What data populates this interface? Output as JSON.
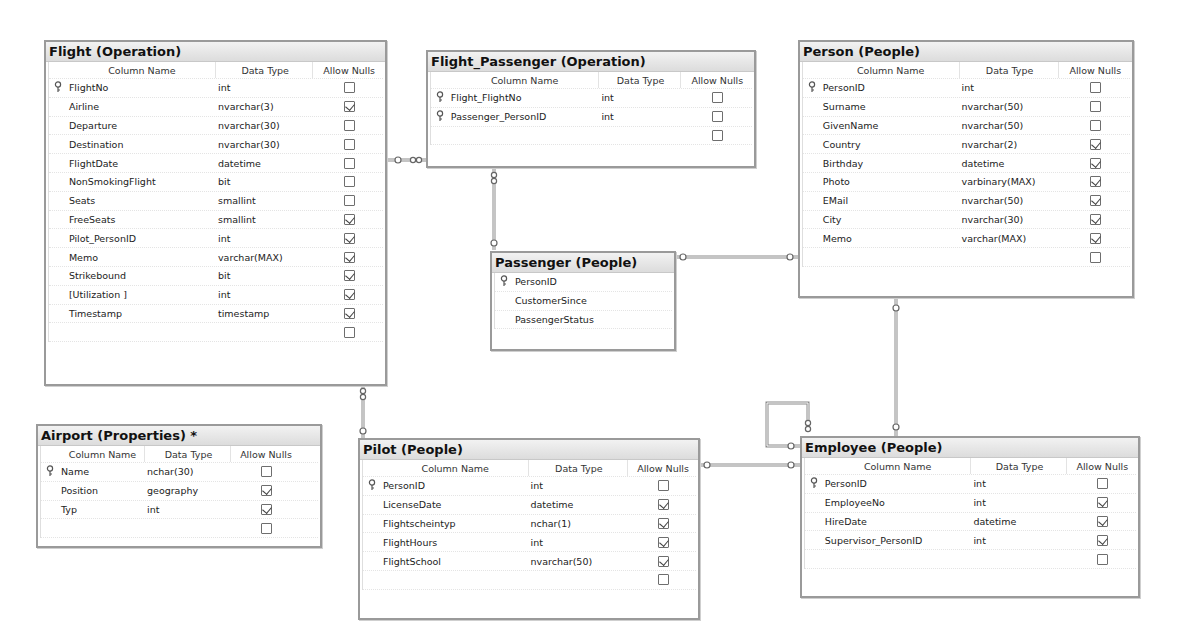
{
  "diagram": {
    "column_headers": {
      "name": "Column Name",
      "type": "Data Type",
      "nulls": "Allow Nulls"
    },
    "icons": {
      "primary_key": "key-icon",
      "checkbox_checked": "checkbox-checked-icon",
      "checkbox_unchecked": "checkbox-unchecked-icon",
      "relationship_connector": "relationship-line"
    },
    "tables": {
      "flight": {
        "title": "Flight (Operation)",
        "rows": [
          {
            "key": true,
            "name": "FlightNo",
            "type": "int",
            "nulls": false
          },
          {
            "key": false,
            "name": "Airline",
            "type": "nvarchar(3)",
            "nulls": true
          },
          {
            "key": false,
            "name": "Departure",
            "type": "nvarchar(30)",
            "nulls": false
          },
          {
            "key": false,
            "name": "Destination",
            "type": "nvarchar(30)",
            "nulls": false
          },
          {
            "key": false,
            "name": "FlightDate",
            "type": "datetime",
            "nulls": false
          },
          {
            "key": false,
            "name": "NonSmokingFlight",
            "type": "bit",
            "nulls": false
          },
          {
            "key": false,
            "name": "Seats",
            "type": "smallint",
            "nulls": false
          },
          {
            "key": false,
            "name": "FreeSeats",
            "type": "smallint",
            "nulls": true
          },
          {
            "key": false,
            "name": "Pilot_PersonID",
            "type": "int",
            "nulls": true
          },
          {
            "key": false,
            "name": "Memo",
            "type": "varchar(MAX)",
            "nulls": true
          },
          {
            "key": false,
            "name": "Strikebound",
            "type": "bit",
            "nulls": true
          },
          {
            "key": false,
            "name": "[Utilization ]",
            "type": "int",
            "nulls": true
          },
          {
            "key": false,
            "name": "Timestamp",
            "type": "timestamp",
            "nulls": true
          },
          {
            "key": false,
            "name": "",
            "type": "",
            "nulls": false
          }
        ]
      },
      "flight_passenger": {
        "title": "Flight_Passenger (Operation)",
        "rows": [
          {
            "key": true,
            "name": "Flight_FlightNo",
            "type": "int",
            "nulls": false
          },
          {
            "key": true,
            "name": "Passenger_PersonID",
            "type": "int",
            "nulls": false
          },
          {
            "key": false,
            "name": "",
            "type": "",
            "nulls": false
          }
        ]
      },
      "person": {
        "title": "Person (People)",
        "rows": [
          {
            "key": true,
            "name": "PersonID",
            "type": "int",
            "nulls": false
          },
          {
            "key": false,
            "name": "Surname",
            "type": "nvarchar(50)",
            "nulls": false
          },
          {
            "key": false,
            "name": "GivenName",
            "type": "nvarchar(50)",
            "nulls": false
          },
          {
            "key": false,
            "name": "Country",
            "type": "nvarchar(2)",
            "nulls": true
          },
          {
            "key": false,
            "name": "Birthday",
            "type": "datetime",
            "nulls": true
          },
          {
            "key": false,
            "name": "Photo",
            "type": "varbinary(MAX)",
            "nulls": true
          },
          {
            "key": false,
            "name": "EMail",
            "type": "nvarchar(50)",
            "nulls": true
          },
          {
            "key": false,
            "name": "City",
            "type": "nvarchar(30)",
            "nulls": true
          },
          {
            "key": false,
            "name": "Memo",
            "type": "varchar(MAX)",
            "nulls": true
          },
          {
            "key": false,
            "name": "",
            "type": "",
            "nulls": false
          }
        ]
      },
      "passenger": {
        "title": "Passenger (People)",
        "rows": [
          {
            "key": true,
            "name": "PersonID"
          },
          {
            "key": false,
            "name": "CustomerSince"
          },
          {
            "key": false,
            "name": "PassengerStatus"
          }
        ]
      },
      "airport": {
        "title": "Airport (Properties) *",
        "rows": [
          {
            "key": true,
            "name": "Name",
            "type": "nchar(30)",
            "nulls": false
          },
          {
            "key": false,
            "name": "Position",
            "type": "geography",
            "nulls": true
          },
          {
            "key": false,
            "name": "Typ",
            "type": "int",
            "nulls": true
          },
          {
            "key": false,
            "name": "",
            "type": "",
            "nulls": false
          }
        ]
      },
      "pilot": {
        "title": "Pilot (People)",
        "rows": [
          {
            "key": true,
            "name": "PersonID",
            "type": "int",
            "nulls": false
          },
          {
            "key": false,
            "name": "LicenseDate",
            "type": "datetime",
            "nulls": true
          },
          {
            "key": false,
            "name": "Flightscheintyp",
            "type": "nchar(1)",
            "nulls": true
          },
          {
            "key": false,
            "name": "FlightHours",
            "type": "int",
            "nulls": true
          },
          {
            "key": false,
            "name": "FlightSchool",
            "type": "nvarchar(50)",
            "nulls": true
          },
          {
            "key": false,
            "name": "",
            "type": "",
            "nulls": false
          }
        ]
      },
      "employee": {
        "title": "Employee (People)",
        "rows": [
          {
            "key": true,
            "name": "PersonID",
            "type": "int",
            "nulls": false
          },
          {
            "key": false,
            "name": "EmployeeNo",
            "type": "int",
            "nulls": true
          },
          {
            "key": false,
            "name": "HireDate",
            "type": "datetime",
            "nulls": true
          },
          {
            "key": false,
            "name": "Supervisor_PersonID",
            "type": "int",
            "nulls": true
          },
          {
            "key": false,
            "name": "",
            "type": "",
            "nulls": false
          }
        ]
      }
    },
    "relationships": [
      {
        "from": "Flight (Operation)",
        "to": "Flight_Passenger (Operation)"
      },
      {
        "from": "Passenger (People)",
        "to": "Flight_Passenger (Operation)"
      },
      {
        "from": "Person (People)",
        "to": "Passenger (People)"
      },
      {
        "from": "Flight (Operation)",
        "to": "Pilot (People)"
      },
      {
        "from": "Employee (People)",
        "to": "Pilot (People)"
      },
      {
        "from": "Person (People)",
        "to": "Employee (People)"
      },
      {
        "from": "Employee (People)",
        "to": "Employee (People)"
      }
    ]
  }
}
